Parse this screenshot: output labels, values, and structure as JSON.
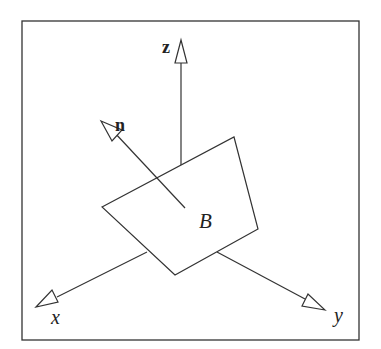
{
  "diagram": {
    "labels": {
      "z_axis": "z",
      "normal": "n",
      "surface": "B",
      "x_axis": "x",
      "y_axis": "y"
    },
    "colors": {
      "stroke": "#333333",
      "background": "#ffffff",
      "fill": "#ffffff"
    }
  }
}
